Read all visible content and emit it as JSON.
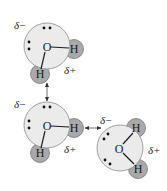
{
  "diagram": {
    "title": "",
    "colors": {
      "oxygen_fill": "#ebebeb",
      "hydrogen_fill": "#a9a9a9",
      "background": "#ffffff"
    },
    "molecules": [
      {
        "id": "top",
        "oxygen_label": "O",
        "hydrogen_labels": [
          "H",
          "H"
        ],
        "partial_negative": "δ−",
        "partial_positive": "δ+"
      },
      {
        "id": "middle",
        "oxygen_label": "O",
        "hydrogen_labels": [
          "H",
          "H"
        ],
        "partial_negative": "δ−",
        "partial_positive": "δ+"
      },
      {
        "id": "right",
        "oxygen_label": "O",
        "hydrogen_labels": [
          "H",
          "H"
        ],
        "partial_negative": "δ−",
        "partial_positive": "δ+"
      }
    ],
    "interactions": [
      {
        "from": "top",
        "to": "middle",
        "type": "hydrogen-bond"
      },
      {
        "from": "middle",
        "to": "right",
        "type": "hydrogen-bond"
      }
    ]
  }
}
